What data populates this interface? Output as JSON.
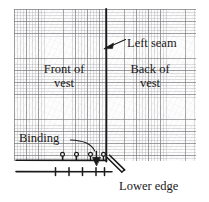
{
  "diagram": {
    "paper": {
      "kind": "graph-paper-grid",
      "major_grid_px": 12,
      "minor_grid_px": 3,
      "grid_color": "#78787d",
      "minor_grid_color": "#96969b",
      "background": "#fdfdfd"
    },
    "ink_color": "#1a1a1a",
    "labels": {
      "left_seam": "Left seam",
      "front_of_vest": "Front of vest",
      "front_of_vest_line1": "Front of",
      "front_of_vest_line2": "vest",
      "back_of_vest": "Back of vest",
      "back_of_vest_line1": "Back of",
      "back_of_vest_line2": "vest",
      "binding": "Binding",
      "lower_edge": "Lower edge"
    },
    "features": {
      "seam_line": "vertical-left-seam-line",
      "binding_line": "horizontal-binding-stitch-line",
      "lower_edge_line": "horizontal-lower-edge-line",
      "pins": "pin-markers",
      "pin_count": 4,
      "tick_marks": "stitch-tick-marks",
      "tick_count": 5,
      "direction_arrow": "down-arrow-marker",
      "binding_fold": "diagonal-folded-binding-end"
    },
    "leaders": {
      "left_seam_arrow": "arrow-pointing-to-seam-line",
      "binding_arrow": "curved-arrow-pointing-to-binding"
    }
  }
}
